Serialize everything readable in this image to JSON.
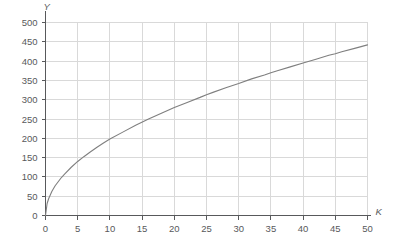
{
  "chart_data": {
    "type": "line",
    "title": "",
    "subtitle": "",
    "xlabel": "K",
    "ylabel": "Y",
    "xlim": [
      0,
      50
    ],
    "ylim": [
      0,
      500
    ],
    "grid": true,
    "legend": null,
    "annotations": [],
    "x_ticks": [
      0,
      5,
      10,
      15,
      20,
      25,
      30,
      35,
      40,
      45,
      50
    ],
    "x_tick_labels": [
      "0",
      "5",
      "10",
      "15",
      "20",
      "25",
      "30",
      "35",
      "40",
      "45",
      "50"
    ],
    "y_ticks": [
      0,
      50,
      100,
      150,
      200,
      250,
      300,
      350,
      400,
      450,
      500
    ],
    "y_tick_labels": [
      "0",
      "50",
      "100",
      "150",
      "200",
      "250",
      "300",
      "350",
      "400",
      "450",
      "500"
    ],
    "series": [
      {
        "name": "Y = 62.5·K^0.5",
        "color": "#7f7f7f",
        "x": [
          0,
          0.25,
          0.5,
          1,
          1.5,
          2,
          2.5,
          3,
          4,
          5,
          6,
          7,
          8,
          9,
          10,
          12,
          14,
          16,
          18,
          20,
          22,
          24,
          25,
          26,
          28,
          30,
          32,
          34,
          35,
          36,
          38,
          40,
          42,
          44,
          45,
          46,
          48,
          50
        ],
        "y": [
          0,
          31,
          44,
          63,
          77,
          88,
          99,
          108,
          125,
          140,
          153,
          165,
          177,
          188,
          198,
          216,
          234,
          250,
          265,
          280,
          293,
          306,
          313,
          319,
          331,
          342,
          354,
          364,
          370,
          375,
          385,
          395,
          405,
          415,
          419,
          424,
          433,
          442
        ]
      }
    ],
    "style": {
      "grid_color": "#d9d9d9",
      "axis_color": "#58595b",
      "curve_color": "#7f7f7f",
      "background": "#ffffff",
      "tick_label_color": "#58595b"
    }
  }
}
